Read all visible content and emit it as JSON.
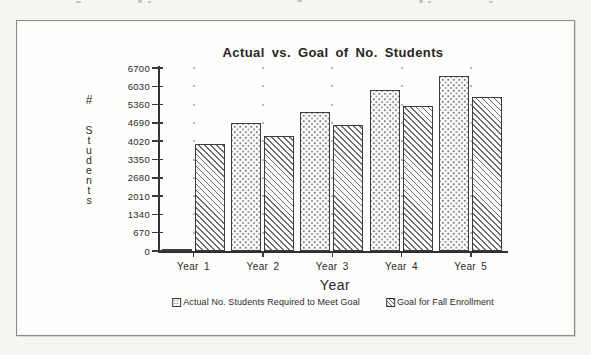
{
  "chart_data": {
    "type": "bar",
    "title": "Actual vs. Goal of No. Students",
    "categories": [
      "Year 1",
      "Year 2",
      "Year 3",
      "Year 4",
      "Year 5"
    ],
    "series": [
      {
        "name": "Actual No. Students Required to Meet Goal",
        "pattern": "dots",
        "values": [
          50,
          4700,
          5100,
          5900,
          6400
        ]
      },
      {
        "name": "Goal for Fall Enrollment",
        "pattern": "hatch",
        "values": [
          3900,
          4200,
          4600,
          5300,
          5650
        ]
      }
    ],
    "xlabel": "Year",
    "ylabel": "# Students",
    "ylim": [
      0,
      6700
    ],
    "yticks": [
      0,
      670,
      1340,
      2010,
      2680,
      3350,
      4020,
      4690,
      5360,
      6030,
      6700
    ],
    "grid": "faint dotted marks at category centers at each tick level",
    "legend_position": "bottom"
  },
  "colors": {
    "page_background": "#f6f5f2",
    "frame_background": "#fdfdfb",
    "frame_border": "#8d8d8d",
    "ink": "#2e2e2e",
    "hatch_line": "#6d6d6d",
    "dot_fill": "#7c7c7c"
  }
}
